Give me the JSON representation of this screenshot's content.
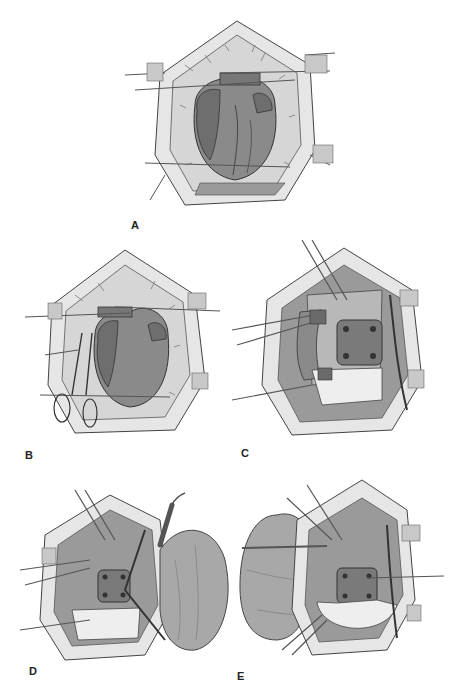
{
  "figure": {
    "panels": [
      {
        "id": "A",
        "label": "A",
        "content": "exposed-heart-median-sternotomy"
      },
      {
        "id": "B",
        "label": "B",
        "content": "heart-with-vascular-clamp"
      },
      {
        "id": "C",
        "label": "C",
        "content": "patch-repair-with-cannulas"
      },
      {
        "id": "D",
        "label": "D",
        "content": "patch-with-cautery-and-retracted-lung-right"
      },
      {
        "id": "E",
        "label": "E",
        "content": "patch-sewn-with-retracted-lung-left"
      }
    ],
    "colors": {
      "background": "#ffffff",
      "tissue": "#e4e4e4",
      "pericardium": "#d2d2d2",
      "heart": "#8a8a8a",
      "heart_dark": "#6e6e6e",
      "lung": "#a8a8a8",
      "patch": "#7a7a7a",
      "outline": "#3a3a3a",
      "instrument": "#f0f0f0"
    }
  }
}
